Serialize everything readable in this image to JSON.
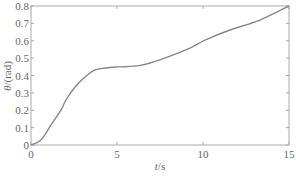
{
  "chart_data": {
    "type": "line",
    "title": "",
    "xlabel": "t/s",
    "ylabel": "θ/(rad)",
    "xlim": [
      0,
      15
    ],
    "ylim": [
      0,
      0.8
    ],
    "xticks": [
      0,
      5,
      10,
      15
    ],
    "yticks": [
      0,
      0.1,
      0.2,
      0.3,
      0.4,
      0.5,
      0.6,
      0.7,
      0.8
    ],
    "xtick_labels": [
      "0",
      "5",
      "10",
      "15"
    ],
    "ytick_labels": [
      "0",
      "0.1",
      "0.2",
      "0.3",
      "0.4",
      "0.5",
      "0.6",
      "0.7",
      "0.8"
    ],
    "grid": false,
    "legend": null,
    "series": [
      {
        "name": "theta",
        "color": "#888888",
        "x": [
          0,
          0.58,
          1.16,
          1.74,
          2.03,
          2.56,
          3.14,
          3.72,
          4.3,
          4.88,
          5.5,
          6.34,
          6.92,
          8.08,
          9.24,
          10.12,
          11.57,
          13.31,
          15
        ],
        "y": [
          0,
          0.029,
          0.115,
          0.201,
          0.259,
          0.334,
          0.391,
          0.432,
          0.443,
          0.449,
          0.45,
          0.458,
          0.472,
          0.512,
          0.558,
          0.604,
          0.662,
          0.719,
          0.8
        ]
      }
    ]
  },
  "colors": {
    "frame": "#aaaaaa",
    "text": "#666666",
    "line": "#888888"
  }
}
